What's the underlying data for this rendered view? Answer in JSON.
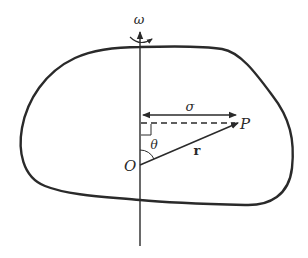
{
  "diagram": {
    "labels": {
      "omega": "ω",
      "sigma": "σ",
      "point": "P",
      "origin": "O",
      "theta": "θ",
      "radius": "r"
    },
    "colors": {
      "stroke": "#2a2a2a",
      "background": "#ffffff"
    }
  }
}
